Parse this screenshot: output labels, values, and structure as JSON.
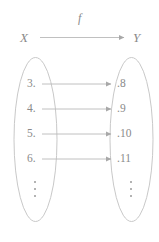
{
  "diagram": {
    "map_label": "f",
    "domain": {
      "label": "X",
      "elements": [
        {
          "value": "3."
        },
        {
          "value": "4."
        },
        {
          "value": "5."
        },
        {
          "value": "6."
        }
      ],
      "continuation": "⋮"
    },
    "codomain": {
      "label": "Y",
      "elements": [
        {
          "value": ".8"
        },
        {
          "value": ".9"
        },
        {
          "value": ".10"
        },
        {
          "value": ".11"
        }
      ],
      "continuation": "⋮"
    },
    "mappings": [
      {
        "from": "3",
        "to": "8"
      },
      {
        "from": "4",
        "to": "9"
      },
      {
        "from": "5",
        "to": "10"
      },
      {
        "from": "6",
        "to": "11"
      }
    ],
    "colors": {
      "stroke": "#b9b9b9",
      "text": "#8a8a8a",
      "background": "#ffffff"
    }
  }
}
